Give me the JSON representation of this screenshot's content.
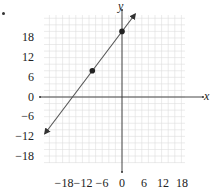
{
  "chart_data": {
    "type": "line",
    "title": "",
    "xlabel": "x",
    "ylabel": "y",
    "xlim": [
      -24,
      19
    ],
    "ylim": [
      -20,
      25
    ],
    "grid": true,
    "grid_minor_step": 2,
    "x_ticks": [
      -18,
      -12,
      -6,
      0,
      6,
      12,
      18
    ],
    "y_ticks": [
      18,
      12,
      6,
      0,
      -6,
      -12,
      -18
    ],
    "x_tick_labels": [
      "−18",
      "−12",
      "−6",
      "0",
      "6",
      "12",
      "18"
    ],
    "y_tick_labels": [
      "18",
      "12",
      "6",
      "0",
      "−6",
      "−12",
      "−18"
    ],
    "series": [
      {
        "name": "line",
        "equation": "y = (4/3)x + 20",
        "slope": 1.3333,
        "intercept": 20,
        "arrows_both_ends": true,
        "x": [
          -23.4,
          4
        ],
        "y": [
          -11.2,
          25.3
        ]
      }
    ],
    "points": [
      {
        "x": 0,
        "y": 20
      },
      {
        "x": -9,
        "y": 8
      }
    ],
    "line_color": "#555555",
    "point_color": "#222222",
    "grid_color": "#dddddd"
  },
  "labels": {
    "x_axis": "x",
    "y_axis": "y",
    "x_ticks": [
      "−18",
      "−12",
      "−6",
      "0",
      "6",
      "12",
      "18"
    ],
    "y_ticks": [
      "18",
      "12",
      "6",
      "0",
      "−6",
      "−12",
      "−18"
    ]
  }
}
